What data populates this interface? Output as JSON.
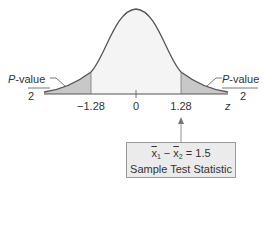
{
  "figure": {
    "left_label": {
      "top": "P-value",
      "bottom": "2"
    },
    "right_label": {
      "top": "P-value",
      "bottom": "2"
    },
    "ticks": [
      {
        "label": "−1.28",
        "x": 91
      },
      {
        "label": "0",
        "x": 136
      },
      {
        "label": "1.28",
        "x": 181
      }
    ],
    "axis_label": "z",
    "box": {
      "line1_x1": "x",
      "line1_sub1": "1",
      "line1_op": " − ",
      "line1_x2": "x",
      "line1_sub2": "2",
      "line1_eq": " = 1.5",
      "line2": "Sample Test Statistic"
    },
    "colors": {
      "shade": "#c8c8c8",
      "center": "#f4f4f4",
      "curve": "#555555"
    }
  }
}
